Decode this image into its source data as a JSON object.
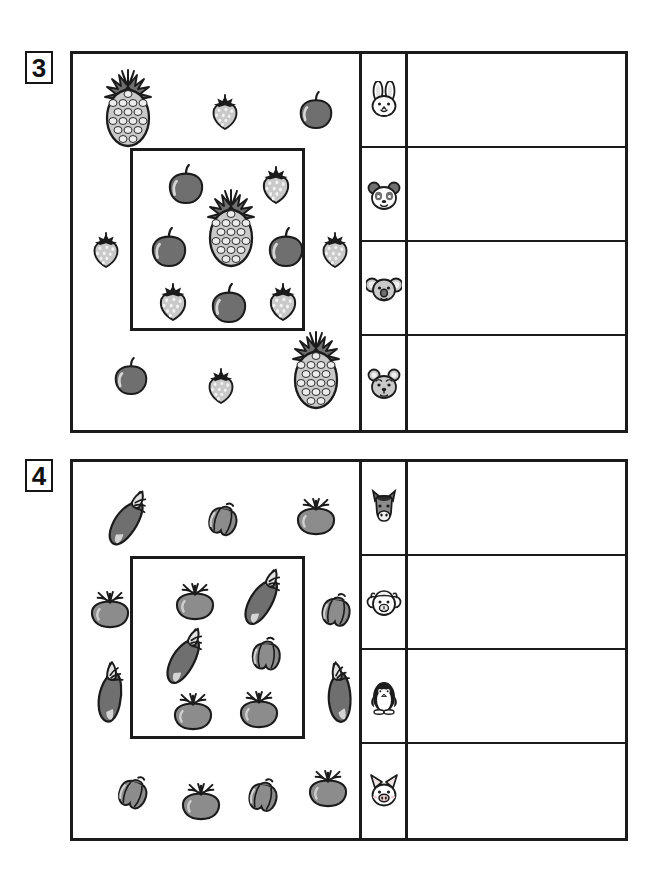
{
  "worksheet": {
    "title": "Counting and sorting worksheet",
    "background": "#ffffff",
    "line_color": "#1b1b1b"
  },
  "exercises": [
    {
      "number": "3",
      "theme": "fruits",
      "inner_box_label": "highlight-box",
      "animals": [
        {
          "name": "rabbit-icon",
          "label": "rabbit"
        },
        {
          "name": "panda-icon",
          "label": "panda"
        },
        {
          "name": "koala-icon",
          "label": "koala"
        },
        {
          "name": "bear-icon",
          "label": "bear"
        }
      ],
      "answers": [
        "",
        "",
        "",
        ""
      ],
      "items_outside": [
        {
          "kind": "pineapple",
          "x": 55,
          "y": 55,
          "scale": 1.0,
          "rot": 0
        },
        {
          "kind": "strawberry",
          "x": 152,
          "y": 58,
          "scale": 0.85,
          "rot": 0
        },
        {
          "kind": "apple",
          "x": 243,
          "y": 57,
          "scale": 0.9,
          "rot": 0
        },
        {
          "kind": "strawberry",
          "x": 33,
          "y": 196,
          "scale": 0.85,
          "rot": 0
        },
        {
          "kind": "strawberry",
          "x": 262,
          "y": 196,
          "scale": 0.85,
          "rot": 0
        },
        {
          "kind": "apple",
          "x": 58,
          "y": 323,
          "scale": 0.9,
          "rot": 0
        },
        {
          "kind": "strawberry",
          "x": 148,
          "y": 332,
          "scale": 0.85,
          "rot": 0
        },
        {
          "kind": "pineapple",
          "x": 243,
          "y": 317,
          "scale": 1.0,
          "rot": 0
        }
      ],
      "items_inside": [
        {
          "kind": "apple",
          "x": 113,
          "y": 131,
          "scale": 0.95,
          "rot": 0
        },
        {
          "kind": "strawberry",
          "x": 203,
          "y": 131,
          "scale": 0.9,
          "rot": 0
        },
        {
          "kind": "pineapple",
          "x": 158,
          "y": 175,
          "scale": 1.0,
          "rot": 0
        },
        {
          "kind": "apple",
          "x": 96,
          "y": 194,
          "scale": 0.95,
          "rot": 0
        },
        {
          "kind": "apple",
          "x": 213,
          "y": 194,
          "scale": 0.95,
          "rot": 0
        },
        {
          "kind": "strawberry",
          "x": 100,
          "y": 248,
          "scale": 0.9,
          "rot": 0
        },
        {
          "kind": "apple",
          "x": 156,
          "y": 250,
          "scale": 0.95,
          "rot": 0
        },
        {
          "kind": "strawberry",
          "x": 210,
          "y": 248,
          "scale": 0.9,
          "rot": 0
        }
      ],
      "counts_inside": {
        "apple": 4,
        "strawberry": 3,
        "pineapple": 1
      }
    },
    {
      "number": "4",
      "theme": "vegetables",
      "inner_box_label": "highlight-box",
      "animals": [
        {
          "name": "horse-icon",
          "label": "horse"
        },
        {
          "name": "sheep-icon",
          "label": "sheep"
        },
        {
          "name": "penguin-icon",
          "label": "penguin"
        },
        {
          "name": "pig-icon",
          "label": "pig"
        }
      ],
      "answers": [
        "",
        "",
        "",
        ""
      ],
      "items_outside": [
        {
          "kind": "eggplant",
          "x": 55,
          "y": 58,
          "scale": 1.0,
          "rot": -35
        },
        {
          "kind": "pepper",
          "x": 150,
          "y": 57,
          "scale": 0.9,
          "rot": 15
        },
        {
          "kind": "tomato",
          "x": 243,
          "y": 55,
          "scale": 0.95,
          "rot": 0
        },
        {
          "kind": "tomato",
          "x": 37,
          "y": 148,
          "scale": 0.95,
          "rot": 0
        },
        {
          "kind": "pepper",
          "x": 263,
          "y": 148,
          "scale": 0.9,
          "rot": 10
        },
        {
          "kind": "eggplant",
          "x": 38,
          "y": 232,
          "scale": 1.0,
          "rot": -60
        },
        {
          "kind": "eggplant",
          "x": 267,
          "y": 232,
          "scale": 1.0,
          "rot": -70
        },
        {
          "kind": "pepper",
          "x": 60,
          "y": 330,
          "scale": 0.9,
          "rot": 20
        },
        {
          "kind": "tomato",
          "x": 128,
          "y": 340,
          "scale": 0.95,
          "rot": 0
        },
        {
          "kind": "pepper",
          "x": 190,
          "y": 333,
          "scale": 0.9,
          "rot": 12
        },
        {
          "kind": "tomato",
          "x": 255,
          "y": 327,
          "scale": 0.95,
          "rot": 0
        }
      ],
      "items_inside": [
        {
          "kind": "tomato",
          "x": 122,
          "y": 140,
          "scale": 0.95,
          "rot": 0
        },
        {
          "kind": "eggplant",
          "x": 190,
          "y": 137,
          "scale": 1.0,
          "rot": -38
        },
        {
          "kind": "eggplant",
          "x": 112,
          "y": 196,
          "scale": 1.0,
          "rot": -38
        },
        {
          "kind": "pepper",
          "x": 193,
          "y": 192,
          "scale": 0.9,
          "rot": 5
        },
        {
          "kind": "tomato",
          "x": 120,
          "y": 250,
          "scale": 0.95,
          "rot": 0
        },
        {
          "kind": "tomato",
          "x": 186,
          "y": 248,
          "scale": 0.95,
          "rot": 0
        }
      ],
      "counts_inside": {
        "tomato": 3,
        "eggplant": 2,
        "pepper": 1
      }
    }
  ],
  "palette": {
    "outline": "#1b1b1b",
    "mid_gray": "#8c8c8c",
    "dark_gray": "#6f6f6f",
    "light_gray": "#c9c9c9",
    "pale_gray": "#d9d9d9",
    "white": "#ffffff"
  }
}
